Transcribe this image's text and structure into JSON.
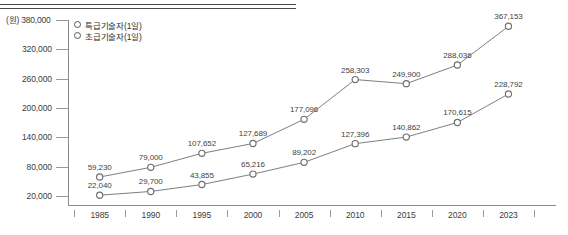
{
  "chart_data": {
    "type": "line",
    "title": "",
    "subtitle": "",
    "xlabel": "",
    "ylabel": "(원)",
    "unit_caption": "(원)",
    "categories": [
      "1985",
      "1990",
      "1995",
      "2000",
      "2005",
      "2010",
      "2015",
      "2020",
      "2023"
    ],
    "ylim": [
      0,
      380000
    ],
    "yticks": [
      380000,
      320000,
      260000,
      200000,
      140000,
      80000,
      20000
    ],
    "ytick_labels": [
      "380,000",
      "320,000",
      "260,000",
      "200,000",
      "140,000",
      "80,000",
      "20,000"
    ],
    "grid": false,
    "legend_position": "top-left",
    "series": [
      {
        "name": "특급기술자(1일)",
        "values": [
          59230,
          79000,
          107652,
          127689,
          177096,
          258303,
          249900,
          288036,
          367153
        ],
        "labels": [
          "59,230",
          "79,000",
          "107,652",
          "127,689",
          "177,096",
          "258,303",
          "249,900",
          "288,036",
          "367,153"
        ],
        "marker": "open-circle",
        "color": "#6f6f6f"
      },
      {
        "name": "초급기술자(1일)",
        "values": [
          22040,
          29700,
          43855,
          65216,
          89202,
          127396,
          140862,
          170615,
          228792
        ],
        "labels": [
          "22,040",
          "29,700",
          "43,855",
          "65,216",
          "89,202",
          "127,396",
          "140,862",
          "170,615",
          "228,792"
        ],
        "marker": "open-circle",
        "color": "#6f6f6f"
      }
    ]
  },
  "legend": {
    "items": [
      {
        "label": "특급기술자(1일)"
      },
      {
        "label": "초급기술자(1일)"
      }
    ]
  },
  "colors": {
    "axis": "#8a8a8a",
    "text": "#3c3c3c",
    "line": "#6f6f6f",
    "rule": "#4a4a4a"
  }
}
